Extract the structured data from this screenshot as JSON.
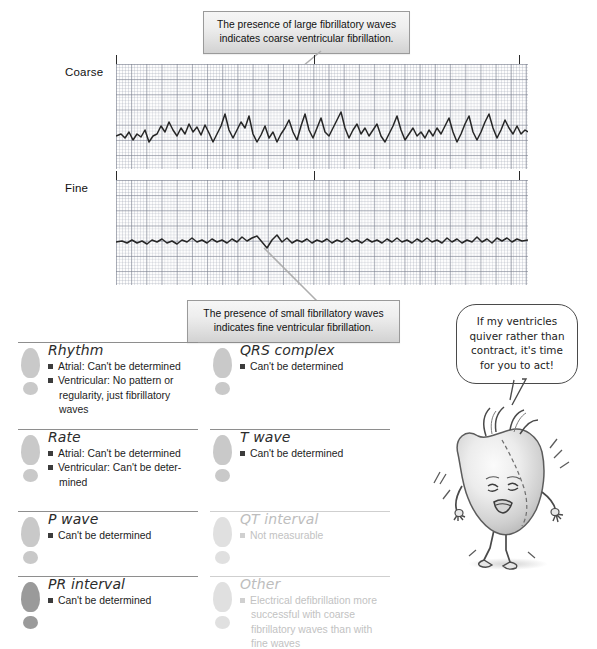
{
  "ecg": {
    "strips": [
      {
        "label": "Coarse",
        "kind": "coarse-vfib"
      },
      {
        "label": "Fine",
        "kind": "fine-vfib"
      }
    ]
  },
  "callouts": [
    {
      "name": "coarse-callout",
      "line1": "The presence of large fibrillatory waves",
      "line2": "indicates coarse ventricular fibrillation."
    },
    {
      "name": "fine-callout",
      "line1": "The presence of small fibrillatory waves",
      "line2": "indicates fine ventricular fibrillation."
    }
  ],
  "findings": {
    "left_column": [
      {
        "title": "Rhythm",
        "faded": false,
        "foot": "normal",
        "items": [
          "Atrial: Can't be determined",
          "Ventricular: No pattern or regularity, just fibrillatory waves"
        ]
      },
      {
        "title": "Rate",
        "faded": false,
        "foot": "normal",
        "items": [
          "Atrial: Can't be determined",
          "Ventricular: Can't be deter-mined"
        ]
      },
      {
        "title": "P wave",
        "faded": false,
        "foot": "normal",
        "items": [
          "Can't be determined"
        ]
      },
      {
        "title": "PR interval",
        "faded": false,
        "foot": "dark",
        "items": [
          "Can't be determined"
        ]
      }
    ],
    "right_column": [
      {
        "title": "QRS complex",
        "faded": false,
        "foot": "normal",
        "items": [
          "Can't be determined"
        ]
      },
      {
        "title": "T wave",
        "faded": false,
        "foot": "normal",
        "items": [
          "Can't be determined"
        ]
      },
      {
        "title": "QT interval",
        "faded": true,
        "foot": "pale",
        "items": [
          "Not measurable"
        ]
      },
      {
        "title": "Other",
        "faded": true,
        "foot": "pale",
        "items": [
          "Electrical defibrillation more successful with coarse fibrillatory waves than with fine waves"
        ]
      }
    ]
  },
  "speech_bubble": {
    "line1": "If my ventricles",
    "line2": "quiver rather than",
    "line3": "contract, it's time",
    "line4": "for you to act!"
  },
  "character": {
    "name": "quivering-heart-character"
  },
  "colors": {
    "grid_major": "#787d8c",
    "grid_minor": "#a0a5b4",
    "trace": "#262626",
    "bullet": "#3c3c3c",
    "footprint": "#c9c9c9",
    "footprint_dark": "#9a9a9a",
    "footprint_pale": "#e0e0e0",
    "divider": "#8e8e8e",
    "faded_text": "#c2c2c2",
    "callout_border": "#9a9a9a"
  }
}
